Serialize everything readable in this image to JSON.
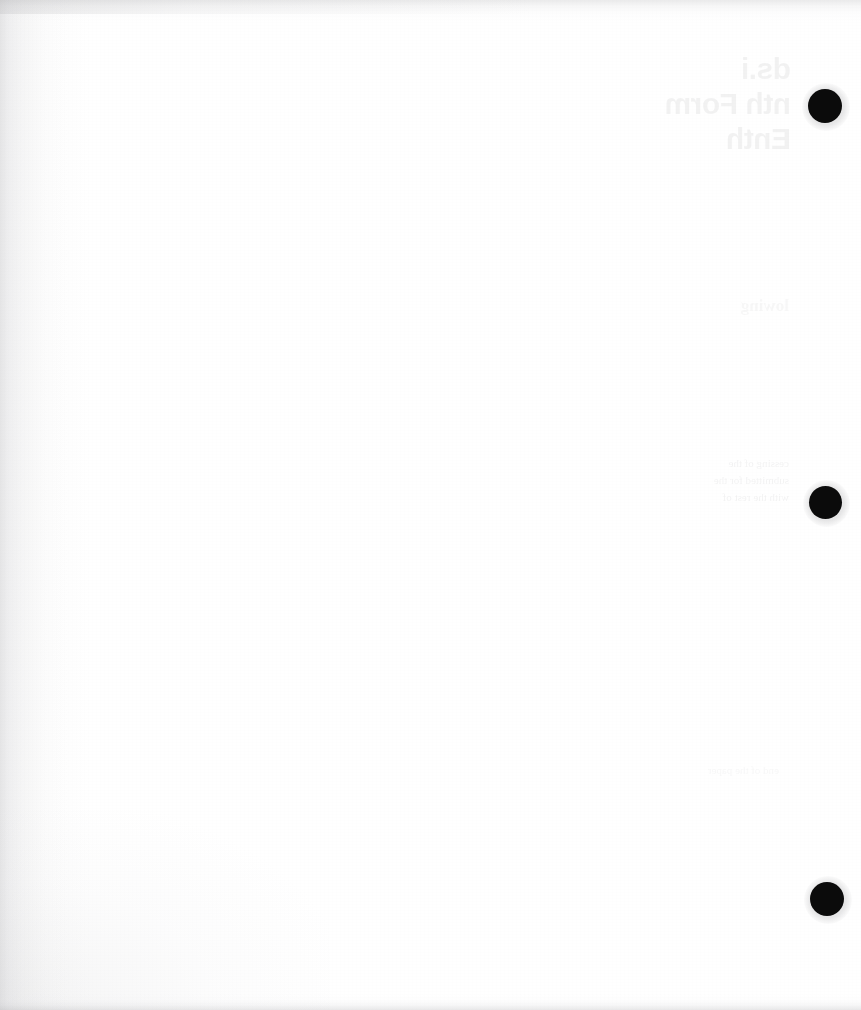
{
  "page": {
    "kind": "scanned-blank-page",
    "width": 861,
    "height": 1010,
    "paper_color": "#fdfdfd",
    "visible_text": "",
    "note": ""
  },
  "colors": {
    "paper": "#fdfdfd",
    "mark": "#0b0b0b",
    "gutter_shadow": "#bcbcbe",
    "edge_smudge": "#bababc",
    "bleed_ink": "#2a2a30"
  },
  "registration_marks": [
    {
      "id": "mark-top",
      "cx": 825,
      "cy": 106,
      "d": 34,
      "color": "#0b0b0b"
    },
    {
      "id": "mark-middle",
      "cx": 826,
      "cy": 503,
      "d": 33,
      "color": "#0b0b0b"
    },
    {
      "id": "mark-bottom",
      "cx": 827,
      "cy": 899,
      "d": 34,
      "color": "#0b0b0b"
    }
  ],
  "bleed_through": {
    "legible": false,
    "description": "mirrored ink show-through from the reverse side of the sheet",
    "heading": {
      "text": "ds.i\nnth Form\nEnth",
      "x": 70,
      "y": 52,
      "size": 30
    },
    "subline": {
      "text": "lowing",
      "x": 72,
      "y": 295,
      "size": 17
    },
    "paragraph": {
      "text": "cessing of the\nsubmitted for the\nwith the rest of",
      "x": 72,
      "y": 455,
      "size": 11
    },
    "trailing_line": {
      "text": "end of the paper",
      "x": 82,
      "y": 762,
      "size": 11
    }
  },
  "edges": {
    "gutter_side": "left",
    "smudge_top": true,
    "smudge_bottom": true
  }
}
